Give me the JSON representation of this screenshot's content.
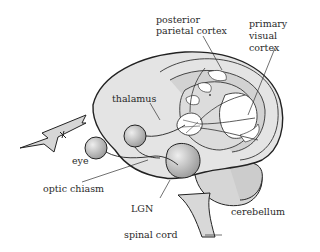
{
  "diagram": {
    "type": "anatomical-illustration",
    "labels": {
      "posterior_parietal_cortex_1": "posterior",
      "posterior_parietal_cortex_2": "parietal cortex",
      "primary_visual_cortex_1": "primary",
      "primary_visual_cortex_2": "visual",
      "primary_visual_cortex_3": "cortex",
      "thalamus": "thalamus",
      "eye": "eye",
      "optic_chiasm": "optic chiasm",
      "lgn": "LGN",
      "cerebellum": "cerebellum",
      "spinal_cord": "spinal cord"
    },
    "colors": {
      "brain_fill": "#e4e4e4",
      "dark_fill": "#cfcfcf",
      "outline": "#222222",
      "white_region": "#ffffff"
    }
  }
}
